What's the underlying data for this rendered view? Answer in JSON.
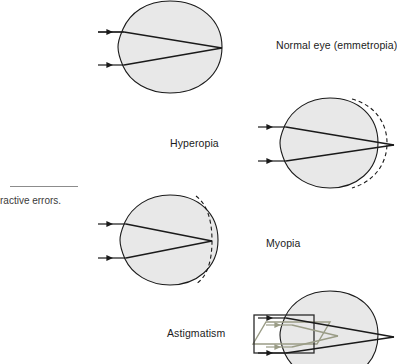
{
  "figure": {
    "title_caption": "ractive errors.",
    "caption_note": "caption text cropped at left edge of image",
    "background_color": "#ffffff",
    "eye_fill_color": "#e8e8e8",
    "eye_stroke_color": "#1a1a1a",
    "ray_color": "#1a1a1a",
    "secondary_ray_color": "#9a9c86",
    "dashed_reference_color": "#1a1a1a",
    "label_color": "#1b1b1b"
  },
  "panels": [
    {
      "id": "normal",
      "label": "Normal eye (emmetropia)",
      "label_x": 276,
      "label_y": 39,
      "eye_cx": 170,
      "eye_cy": 47,
      "eye_rx": 52,
      "eye_ry": 46,
      "has_dashed_arc": false,
      "focus_x": 222,
      "focus_y": 48,
      "ray_start_x": 98,
      "ray_top_y": 32,
      "ray_bottom_y": 65,
      "cornea_top_y": 32,
      "cornea_bottom_y": 65,
      "description": "Parallel light rays focus precisely on the retina at the back of the eye"
    },
    {
      "id": "hyperopia",
      "label": "Hyperopia",
      "label_x": 170,
      "label_y": 137,
      "eye_cx": 330,
      "eye_cy": 143,
      "eye_rx": 50,
      "eye_ry": 45,
      "has_dashed_arc": true,
      "dashed_arc_side": "outside",
      "focus_x": 391,
      "focus_y": 144,
      "ray_start_x": 258,
      "ray_top_y": 127,
      "ray_bottom_y": 161,
      "description": "Eyeball too short; light focuses behind the retina. Dashed arc marks normal eye length"
    },
    {
      "id": "myopia",
      "label": "Myopia",
      "label_x": 266,
      "label_y": 237,
      "eye_cx": 170,
      "eye_cy": 240,
      "eye_rx": 50,
      "eye_ry": 45,
      "has_dashed_arc": true,
      "dashed_arc_side": "inside",
      "focus_x": 212,
      "focus_y": 241,
      "ray_start_x": 98,
      "ray_top_y": 224,
      "ray_bottom_y": 258,
      "description": "Eyeball too long; light focuses in front of the retina. Dashed arc marks normal eye length"
    },
    {
      "id": "astigmatism",
      "label": "Astigmatism",
      "label_x": 167,
      "label_y": 327,
      "eye_cx": 330,
      "eye_cy": 335,
      "eye_rx": 50,
      "eye_ry": 45,
      "has_dashed_arc": false,
      "focus_x": 391,
      "focus_y": 336,
      "ray_start_x": 258,
      "ray_top_y": 318,
      "ray_bottom_y": 353,
      "has_meridian_shapes": true,
      "description": "Irregular corneal curvature; two meridians focus at different points, shown as overlapping rectangle and parallelogram"
    }
  ],
  "caption_rule": {
    "x": 10,
    "y": 186,
    "width": 68
  },
  "caption_position": {
    "x": 0,
    "y": 195
  }
}
